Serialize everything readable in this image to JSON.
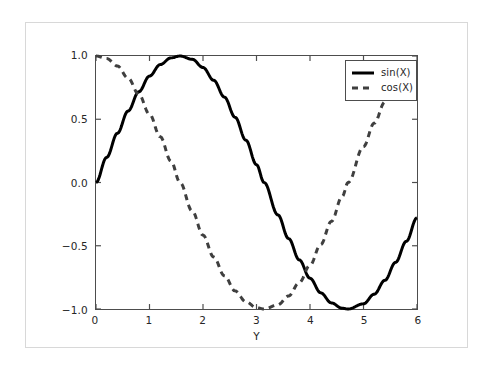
{
  "chart_data": {
    "type": "line",
    "title": "",
    "subtitle": "",
    "xlabel": "Y",
    "ylabel": "",
    "xlim": [
      0,
      6
    ],
    "ylim": [
      -1.0,
      1.0
    ],
    "grid": false,
    "legend_position": "upper right",
    "xticks": [
      0,
      1,
      2,
      3,
      4,
      5,
      6
    ],
    "xtick_labels": [
      "0",
      "1",
      "2",
      "3",
      "4",
      "5",
      "6"
    ],
    "yticks": [
      -1.0,
      -0.5,
      0.0,
      0.5,
      1.0
    ],
    "ytick_labels": [
      "-1.0",
      "-0.5",
      "0.0",
      "0.5",
      "1.0"
    ],
    "series": [
      {
        "name": "sin(X)",
        "style": "solid",
        "color": "#000000",
        "width": 3.0,
        "x": [
          0.0,
          0.2,
          0.4,
          0.6,
          0.8,
          1.0,
          1.2,
          1.4,
          1.5708,
          1.8,
          2.0,
          2.2,
          2.4,
          2.6,
          2.8,
          3.0,
          3.1416,
          3.4,
          3.6,
          3.8,
          4.0,
          4.2,
          4.4,
          4.6,
          4.7124,
          5.0,
          5.2,
          5.4,
          5.6,
          5.8,
          6.0
        ],
        "values": [
          0.0,
          0.199,
          0.389,
          0.565,
          0.717,
          0.841,
          0.932,
          0.985,
          1.0,
          0.974,
          0.909,
          0.808,
          0.675,
          0.516,
          0.335,
          0.141,
          0.0,
          -0.256,
          -0.443,
          -0.612,
          -0.757,
          -0.872,
          -0.952,
          -0.994,
          -1.0,
          -0.959,
          -0.883,
          -0.773,
          -0.631,
          -0.465,
          -0.279
        ]
      },
      {
        "name": "cos(X)",
        "style": "dashed",
        "color": "#3f3f3f",
        "width": 3.0,
        "x": [
          0.0,
          0.2,
          0.4,
          0.6,
          0.8,
          1.0,
          1.2,
          1.4,
          1.5708,
          1.8,
          2.0,
          2.2,
          2.4,
          2.6,
          2.8,
          3.0,
          3.1416,
          3.4,
          3.6,
          3.8,
          4.0,
          4.2,
          4.4,
          4.6,
          4.7124,
          5.0,
          5.2,
          5.4,
          5.6,
          5.8,
          6.0
        ],
        "values": [
          1.0,
          0.98,
          0.921,
          0.825,
          0.697,
          0.54,
          0.362,
          0.17,
          0.0,
          -0.227,
          -0.416,
          -0.589,
          -0.737,
          -0.857,
          -0.942,
          -0.99,
          -1.0,
          -0.967,
          -0.897,
          -0.791,
          -0.654,
          -0.49,
          -0.307,
          -0.112,
          0.0,
          0.284,
          0.469,
          0.635,
          0.776,
          0.886,
          0.96
        ]
      }
    ],
    "legend_entries": [
      {
        "label": "sin(X)",
        "style": "solid"
      },
      {
        "label": "cos(X)",
        "style": "dashed"
      }
    ],
    "annotations": []
  }
}
